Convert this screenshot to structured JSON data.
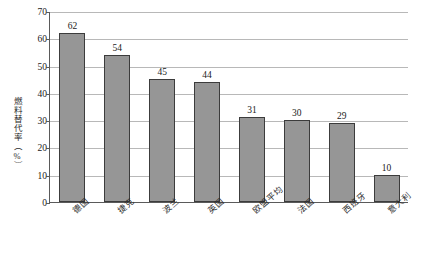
{
  "chart_data": {
    "type": "bar",
    "title": "",
    "subtitle": "",
    "xlabel": "",
    "ylabel": "燃料替代率（%）",
    "ylim": [
      0,
      70
    ],
    "ytick_step": 10,
    "yticks": [
      70,
      60,
      50,
      40,
      30,
      20,
      10,
      0
    ],
    "grid": true,
    "legend": false,
    "legend_position": "none",
    "categories": [
      "德国",
      "捷克",
      "波兰",
      "英国",
      "欧盟平均",
      "法国",
      "西班牙",
      "意大利"
    ],
    "values": [
      62,
      54,
      45,
      44,
      31,
      30,
      29,
      10
    ],
    "data_labels": [
      "62",
      "54",
      "45",
      "44",
      "31",
      "30",
      "29",
      "10"
    ],
    "series": [
      {
        "name": "燃料替代率",
        "values": [
          62,
          54,
          45,
          44,
          31,
          30,
          29,
          10
        ]
      }
    ],
    "colors": {
      "bar_fill": "#969696",
      "bar_border": "#3c3c3c",
      "gridline": "#b8b8b8",
      "axis": "#5a5a5a",
      "text": "#1a1a1a",
      "background": "#ffffff"
    }
  }
}
